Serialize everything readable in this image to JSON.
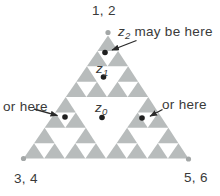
{
  "figure": {
    "background": "#ffffff",
    "fractal_color": "#b8bcbc",
    "vertex_dot_color": "#a3a7a7",
    "point_dot_color": "#1f1f1f",
    "arrow_color": "#2a2a2a",
    "text_color": "#3a3a3a",
    "fractal_depth": 3
  },
  "labels": {
    "top_vertex": "1, 2",
    "bottom_left_vertex": "3, 4",
    "bottom_right_vertex": "5, 6",
    "or_here_left": "or here",
    "or_here_right": "or here",
    "z2": {
      "base": "z",
      "sub": "2",
      "rest": " may be here"
    },
    "z1": {
      "base": "z",
      "sub": "1"
    },
    "z0": {
      "base": "z",
      "sub": "0"
    }
  }
}
